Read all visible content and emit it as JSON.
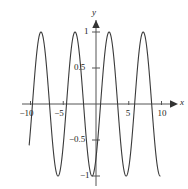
{
  "figure": {
    "title": "",
    "background": "#ffffff",
    "curve_color": "#3a3a3a",
    "axis_color": "#555555",
    "width": 188,
    "height": 189
  },
  "axes": {
    "x_axis_label": "x",
    "y_axis_label": "y",
    "origin_px": {
      "x": 96,
      "y": 104
    },
    "x_scale_px_per_unit": 6.55,
    "y_scale_px_per_unit": 72,
    "x_ticks": [
      {
        "value": -10,
        "label": "−10"
      },
      {
        "value": -5,
        "label": "−5"
      },
      {
        "value": 5,
        "label": "5"
      },
      {
        "value": 10,
        "label": "10"
      }
    ],
    "y_ticks": [
      {
        "value": 1,
        "label": "1"
      },
      {
        "value": 0.5,
        "label": "0.5"
      },
      {
        "value": -0.5,
        "label": "−0.5"
      },
      {
        "value": -1,
        "label": "−1"
      }
    ],
    "arrows": [
      "x-positive",
      "y-positive"
    ]
  },
  "chart_data": {
    "type": "line",
    "title": "",
    "xlabel": "x",
    "ylabel": "y",
    "xlim": [
      -10.2,
      9.8
    ],
    "ylim": [
      -1.05,
      1.05
    ],
    "grid": false,
    "legend": null,
    "series": [
      {
        "name": "sinusoid",
        "function": "sin(2*pi*(x-2.0)/5.2)",
        "amplitude": 1,
        "period": 5.2,
        "phase_peak_x": 2.0,
        "samples": 800,
        "peaks": [
          {
            "x": -8.4,
            "y": 1
          },
          {
            "x": -3.2,
            "y": 1
          },
          {
            "x": 2.0,
            "y": 1
          },
          {
            "x": 7.2,
            "y": 1
          }
        ],
        "troughs": [
          {
            "x": -10.8,
            "y": -1
          },
          {
            "x": -5.8,
            "y": -1
          },
          {
            "x": -0.6,
            "y": -1
          },
          {
            "x": 4.6,
            "y": -1
          }
        ],
        "zero_crossings": [
          -9.6,
          -7.0,
          -4.5,
          -1.9,
          0.7,
          3.3,
          5.9,
          8.5
        ]
      }
    ]
  }
}
